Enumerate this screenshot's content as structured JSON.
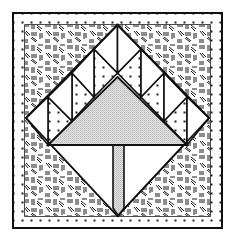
{
  "figure": {
    "colors": {
      "line": "#111111",
      "background": "#ffffff",
      "tree_fill": "#d8d8d8",
      "trunk_fill": "#d0d0d0",
      "dot": "#222222",
      "hatch": "#1a1a1a"
    },
    "pieces": {
      "outer_border": "dotted-border",
      "corner_fill": "hatched-confetti",
      "diamond_outline": "white",
      "sawtooth_light": "white",
      "sawtooth_dotted": "dotted",
      "canopy": "gray-triangle",
      "trunk": "gray-stem"
    }
  }
}
